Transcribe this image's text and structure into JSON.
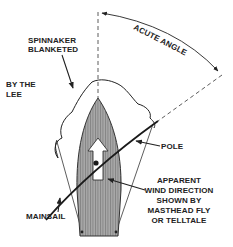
{
  "diagram": {
    "labels": {
      "spinnaker_line1": "SPINNAKER",
      "spinnaker_line2": "BLANKETED",
      "bythelee_line1": "BY THE",
      "bythelee_line2": "LEE",
      "acute_angle": "ACUTE ANGLE",
      "pole": "POLE",
      "apparent_line1": "APPARENT",
      "apparent_line2": "WIND DIRECTION",
      "apparent_line3": "SHOWN BY",
      "apparent_line4": "MASTHEAD FLY",
      "apparent_line5": "OR TELLTALE",
      "mainsail": "MAINSAIL"
    },
    "colors": {
      "ink": "#222222",
      "hull_fill": "#9a9a9a",
      "background": "#ffffff"
    }
  }
}
